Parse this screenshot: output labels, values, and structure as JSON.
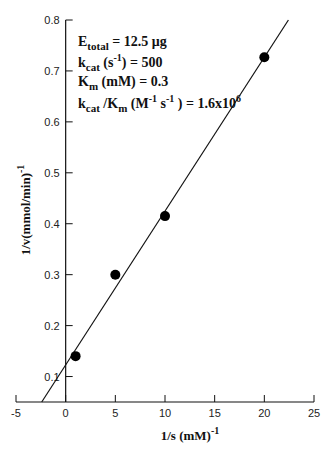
{
  "chart_data": {
    "type": "scatter",
    "title": "",
    "xlabel": "1/s (mM)",
    "xlabel_sup": "-1",
    "ylabel": "1/v(mmol/min)",
    "ylabel_sup": "-1",
    "xlim": [
      -5,
      25
    ],
    "ylim": [
      0.05,
      0.8
    ],
    "x_ticks": [
      -5,
      0,
      5,
      10,
      15,
      20,
      25
    ],
    "x_tick_labels": [
      "-5",
      "0",
      "5",
      "10",
      "15",
      "20",
      "25"
    ],
    "y_ticks": [
      0.1,
      0.2,
      0.3,
      0.4,
      0.5,
      0.6,
      0.7,
      0.8
    ],
    "y_tick_labels": [
      "0.1",
      "0.2",
      "0.3",
      "0.4",
      "0.5",
      "0.6",
      "0.7",
      "0.8"
    ],
    "grid": false,
    "series": [
      {
        "name": "data",
        "x": [
          1,
          5,
          10,
          20
        ],
        "y": [
          0.14,
          0.3,
          0.415,
          0.727
        ]
      }
    ],
    "fit_line": {
      "slope": 0.0302,
      "intercept": 0.1228
    },
    "annotations": [
      {
        "main": "E",
        "sub": "total",
        "rest": " = 12.5 μg"
      },
      {
        "main": "k",
        "sub": "cat",
        "rest": " (s",
        "sup": "-1",
        "rest2": ") = 500"
      },
      {
        "main": "K",
        "sub": "m",
        "rest": " (mM) = 0.3"
      },
      {
        "main": "k",
        "sub": "cat",
        "rest": " /K",
        "sub2": "m",
        "rest2": " (M",
        "sup": "-1",
        "rest3": " s",
        "sup2": "-1",
        "rest4": " ) = 1.6x10",
        "sup3": "6"
      }
    ]
  }
}
